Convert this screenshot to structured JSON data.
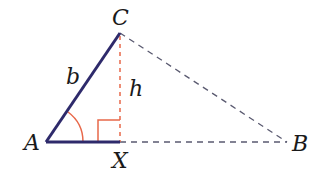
{
  "diagram": {
    "type": "triangle-altitude",
    "vertices": {
      "A": {
        "label": "A",
        "x": 46,
        "y": 142
      },
      "B": {
        "label": "B",
        "x": 287,
        "y": 142
      },
      "C": {
        "label": "C",
        "x": 120,
        "y": 33
      },
      "X": {
        "label": "X",
        "x": 120,
        "y": 142
      }
    },
    "labels": {
      "A": "A",
      "B": "B",
      "C": "C",
      "X": "X",
      "side_b": "b",
      "height_h": "h"
    },
    "colors": {
      "solid_side": "#2e2a6b",
      "dashed_side": "#5a5a70",
      "altitude": "#e8684a",
      "angle_marker": "#e8684a"
    }
  }
}
